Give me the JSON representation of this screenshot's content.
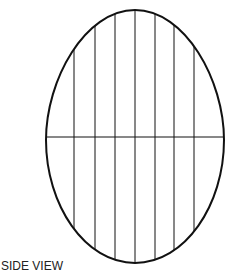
{
  "diagram": {
    "caption": "SIDE VIEW",
    "shape": "egg",
    "stroke_color": "#111111",
    "outline": {
      "cx": 135,
      "top": 10,
      "bottom": 263,
      "left": 46,
      "right": 224,
      "widest_y": 140
    },
    "horizontal_line_y": 137,
    "vertical_lines_x": [
      74,
      95,
      115,
      135,
      155,
      174,
      194
    ]
  }
}
